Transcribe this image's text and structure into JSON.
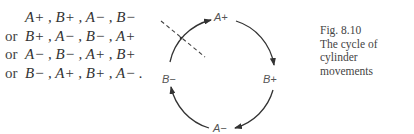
{
  "sequences": [
    {
      "prefix": "",
      "terms": "A+ , B+ , A− , B−"
    },
    {
      "prefix": "or",
      "terms": "B+ , A− , B− , A+"
    },
    {
      "prefix": "or",
      "terms": "A− , B− , A+ , B+"
    },
    {
      "prefix": "or",
      "terms": "B− , A+ , B+ , A− ."
    }
  ],
  "diagram": {
    "nodes": {
      "top": "A+",
      "right": "B+",
      "bottom": "A−",
      "left": "B−"
    },
    "direction": "clockwise",
    "cut_line": "dashed"
  },
  "caption": {
    "figure": "Fig. 8.10",
    "line1": "The cycle of cylinder",
    "line2": "movements"
  }
}
